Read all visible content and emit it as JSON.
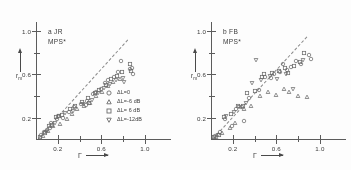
{
  "figure": {
    "background": "#fdfdfc",
    "ink": "#5c5c5c",
    "marker_color": "#6b6b6b"
  },
  "chart_data": [
    {
      "type": "scatter",
      "panel": "a",
      "title": "a  JR",
      "subtitle": "MPS*",
      "xlabel": "Γ",
      "ylabel": "r",
      "ylabel_sub": "m",
      "xlim": [
        0.0,
        1.12
      ],
      "ylim": [
        0.0,
        1.08
      ],
      "xticks": [
        0.2,
        0.6,
        1.0
      ],
      "xtick_labels": [
        "0.2",
        "0.6",
        "1.0"
      ],
      "xticks_minor": [
        0.4,
        0.8
      ],
      "yticks": [
        0.2,
        0.6,
        1.0
      ],
      "ytick_labels": [
        "0.2",
        "0.6",
        "1.0"
      ],
      "yticks_minor": [
        0.4,
        0.8
      ],
      "grid": false,
      "reference_line": {
        "style": "dashed",
        "from": [
          0.02,
          0.02
        ],
        "to": [
          0.84,
          0.92
        ]
      },
      "series": [
        {
          "name": "ΔL=0",
          "marker": "circle",
          "points": [
            [
              0.05,
              0.05
            ],
            [
              0.07,
              0.07
            ],
            [
              0.1,
              0.09
            ],
            [
              0.13,
              0.11
            ],
            [
              0.14,
              0.16
            ],
            [
              0.19,
              0.19
            ],
            [
              0.2,
              0.22
            ],
            [
              0.25,
              0.2
            ],
            [
              0.3,
              0.26
            ],
            [
              0.35,
              0.3
            ],
            [
              0.41,
              0.33
            ],
            [
              0.46,
              0.32
            ],
            [
              0.47,
              0.36
            ],
            [
              0.52,
              0.42
            ],
            [
              0.55,
              0.44
            ],
            [
              0.6,
              0.47
            ],
            [
              0.63,
              0.52
            ],
            [
              0.66,
              0.55
            ],
            [
              0.72,
              0.58
            ],
            [
              0.75,
              0.62
            ],
            [
              0.78,
              0.72
            ],
            [
              0.86,
              0.65
            ],
            [
              0.88,
              0.66
            ],
            [
              0.89,
              0.6
            ]
          ]
        },
        {
          "name": "ΔL=-6 dB",
          "marker": "triangle-up",
          "points": [
            [
              0.06,
              0.04
            ],
            [
              0.11,
              0.08
            ],
            [
              0.16,
              0.13
            ],
            [
              0.22,
              0.15
            ],
            [
              0.28,
              0.19
            ],
            [
              0.33,
              0.24
            ],
            [
              0.38,
              0.28
            ],
            [
              0.44,
              0.31
            ],
            [
              0.5,
              0.34
            ],
            [
              0.55,
              0.4
            ],
            [
              0.61,
              0.44
            ],
            [
              0.66,
              0.49
            ],
            [
              0.71,
              0.53
            ],
            [
              0.77,
              0.56
            ]
          ]
        },
        {
          "name": "ΔL= 6 dB",
          "marker": "square",
          "points": [
            [
              0.04,
              0.03
            ],
            [
              0.08,
              0.06
            ],
            [
              0.12,
              0.13
            ],
            [
              0.15,
              0.14
            ],
            [
              0.18,
              0.21
            ],
            [
              0.21,
              0.22
            ],
            [
              0.24,
              0.23
            ],
            [
              0.31,
              0.28
            ],
            [
              0.36,
              0.31
            ],
            [
              0.42,
              0.35
            ],
            [
              0.48,
              0.38
            ],
            [
              0.49,
              0.34
            ],
            [
              0.54,
              0.43
            ],
            [
              0.58,
              0.46
            ],
            [
              0.64,
              0.5
            ],
            [
              0.69,
              0.56
            ],
            [
              0.74,
              0.59
            ],
            [
              0.79,
              0.62
            ],
            [
              0.86,
              0.7
            ],
            [
              0.87,
              0.63
            ]
          ]
        },
        {
          "name": "ΔL=-12dB",
          "marker": "triangle-down",
          "points": [
            [
              0.09,
              0.07
            ],
            [
              0.17,
              0.16
            ],
            [
              0.27,
              0.25
            ],
            [
              0.34,
              0.27
            ],
            [
              0.43,
              0.33
            ],
            [
              0.51,
              0.37
            ],
            [
              0.57,
              0.43
            ],
            [
              0.62,
              0.48
            ],
            [
              0.68,
              0.51
            ],
            [
              0.73,
              0.55
            ],
            [
              0.8,
              0.57
            ],
            [
              0.81,
              0.53
            ]
          ]
        }
      ],
      "legend": {
        "position": "inside-lower-right",
        "entries": [
          {
            "marker": "circle",
            "label": "ΔL=0"
          },
          {
            "marker": "triangle-up",
            "label": "ΔL=-6 dB"
          },
          {
            "marker": "square",
            "label": "ΔL= 6 dB"
          },
          {
            "marker": "triangle-down",
            "label": "ΔL=-12dB"
          }
        ]
      }
    },
    {
      "type": "scatter",
      "panel": "b",
      "title": "b  FB",
      "subtitle": "MPS*",
      "xlabel": "Γ",
      "ylabel": "r",
      "ylabel_sub": "m",
      "xlim": [
        0.0,
        1.12
      ],
      "ylim": [
        0.0,
        1.08
      ],
      "xticks": [
        0.2,
        0.6,
        1.0
      ],
      "xtick_labels": [
        "0.2",
        "0.6",
        "1.0"
      ],
      "xticks_minor": [
        0.4,
        0.8
      ],
      "yticks": [
        0.2,
        0.6,
        1.0
      ],
      "ytick_labels": [
        "0.2",
        "0.6",
        "1.0"
      ],
      "yticks_minor": [
        0.4,
        0.8
      ],
      "grid": false,
      "reference_line": {
        "style": "dashed",
        "from": [
          0.02,
          0.02
        ],
        "to": [
          0.88,
          0.95
        ]
      },
      "series": [
        {
          "name": "ΔL=0",
          "marker": "circle",
          "points": [
            [
              0.04,
              0.04
            ],
            [
              0.08,
              0.07
            ],
            [
              0.13,
              0.19
            ],
            [
              0.19,
              0.13
            ],
            [
              0.23,
              0.28
            ],
            [
              0.28,
              0.3
            ],
            [
              0.3,
              0.17
            ],
            [
              0.35,
              0.38
            ],
            [
              0.44,
              0.46
            ],
            [
              0.5,
              0.58
            ],
            [
              0.55,
              0.57
            ],
            [
              0.58,
              0.6
            ],
            [
              0.63,
              0.62
            ],
            [
              0.66,
              0.7
            ],
            [
              0.7,
              0.64
            ],
            [
              0.73,
              0.67
            ],
            [
              0.78,
              0.72
            ],
            [
              0.83,
              0.7
            ],
            [
              0.9,
              0.78
            ],
            [
              0.92,
              0.74
            ]
          ]
        },
        {
          "name": "ΔL=-6 dB",
          "marker": "triangle-up",
          "points": [
            [
              0.05,
              0.03
            ],
            [
              0.1,
              0.06
            ],
            [
              0.17,
              0.11
            ],
            [
              0.22,
              0.16
            ],
            [
              0.3,
              0.28
            ],
            [
              0.37,
              0.31
            ],
            [
              0.45,
              0.4
            ],
            [
              0.52,
              0.44
            ],
            [
              0.6,
              0.41
            ],
            [
              0.67,
              0.47
            ],
            [
              0.72,
              0.44
            ],
            [
              0.8,
              0.4
            ],
            [
              0.88,
              0.39
            ]
          ]
        },
        {
          "name": "ΔL= 6 dB",
          "marker": "square",
          "points": [
            [
              0.03,
              0.03
            ],
            [
              0.07,
              0.05
            ],
            [
              0.12,
              0.21
            ],
            [
              0.18,
              0.24
            ],
            [
              0.25,
              0.31
            ],
            [
              0.29,
              0.31
            ],
            [
              0.33,
              0.43
            ],
            [
              0.4,
              0.45
            ],
            [
              0.47,
              0.58
            ],
            [
              0.49,
              0.6
            ],
            [
              0.56,
              0.61
            ],
            [
              0.62,
              0.63
            ],
            [
              0.68,
              0.66
            ],
            [
              0.71,
              0.61
            ],
            [
              0.76,
              0.68
            ],
            [
              0.82,
              0.71
            ],
            [
              0.85,
              0.8
            ]
          ]
        },
        {
          "name": "ΔL=-12dB",
          "marker": "triangle-down",
          "points": [
            [
              0.06,
              0.05
            ],
            [
              0.14,
              0.22
            ],
            [
              0.21,
              0.26
            ],
            [
              0.26,
              0.3
            ],
            [
              0.32,
              0.34
            ],
            [
              0.38,
              0.52
            ],
            [
              0.41,
              0.73
            ],
            [
              0.46,
              0.55
            ],
            [
              0.54,
              0.59
            ],
            [
              0.61,
              0.56
            ],
            [
              0.69,
              0.6
            ],
            [
              0.75,
              0.47
            ],
            [
              0.84,
              0.73
            ]
          ]
        }
      ],
      "legend": {
        "position": "none",
        "entries": []
      }
    }
  ]
}
